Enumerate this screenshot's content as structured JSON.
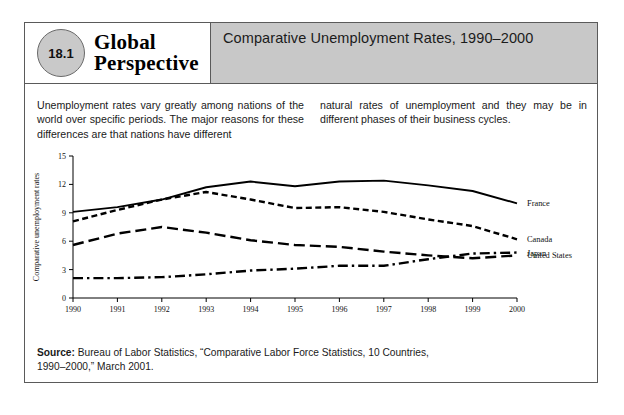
{
  "header": {
    "badge_number": "18.1",
    "brand_line1": "Global",
    "brand_line2": "Perspective",
    "title": "Comparative Unemployment Rates, 1990–2000"
  },
  "body": {
    "paragraph_left": "Unemployment rates vary greatly among nations of the world over specific periods. The major reasons for these differences are that nations have different",
    "paragraph_right": "natural rates of unemployment and they may be in different phases of their business cycles."
  },
  "source": {
    "label": "Source:",
    "text": " Bureau of Labor Statistics, “Comparative Labor Force Statistics, 10 Countries, 1990–2000,” March 2001."
  },
  "chart_data": {
    "type": "line",
    "title": "Comparative Unemployment Rates, 1990–2000",
    "xlabel": "Year",
    "ylabel": "Comparative unemployment rates",
    "x": [
      1990,
      1991,
      1992,
      1993,
      1994,
      1995,
      1996,
      1997,
      1998,
      1999,
      2000
    ],
    "xtick_labels": [
      "1990",
      "1991",
      "1992",
      "1993",
      "1994",
      "1995",
      "1996",
      "1997",
      "1998",
      "1999",
      "2000"
    ],
    "ytick_labels": [
      "0",
      "3",
      "6",
      "9",
      "12",
      "15"
    ],
    "yticks": [
      0,
      3,
      6,
      9,
      12,
      15
    ],
    "ylim": [
      0,
      15
    ],
    "xlim": [
      1990,
      2000
    ],
    "grid": false,
    "legend_position": "right-inline",
    "series": [
      {
        "name": "France",
        "style": "solid",
        "values": [
          9.1,
          9.6,
          10.4,
          11.7,
          12.3,
          11.8,
          12.3,
          12.4,
          11.9,
          11.3,
          10.0
        ]
      },
      {
        "name": "Canada",
        "style": "short-dash",
        "values": [
          8.1,
          9.3,
          10.4,
          11.2,
          10.4,
          9.5,
          9.6,
          9.1,
          8.3,
          7.6,
          6.2
        ]
      },
      {
        "name": "Japan",
        "style": "dash-dot",
        "values": [
          2.1,
          2.1,
          2.2,
          2.5,
          2.9,
          3.1,
          3.4,
          3.4,
          4.1,
          4.7,
          4.8
        ]
      },
      {
        "name": "United States",
        "style": "long-dash",
        "values": [
          5.6,
          6.8,
          7.5,
          6.9,
          6.1,
          5.6,
          5.4,
          4.9,
          4.5,
          4.2,
          4.5
        ]
      }
    ]
  }
}
